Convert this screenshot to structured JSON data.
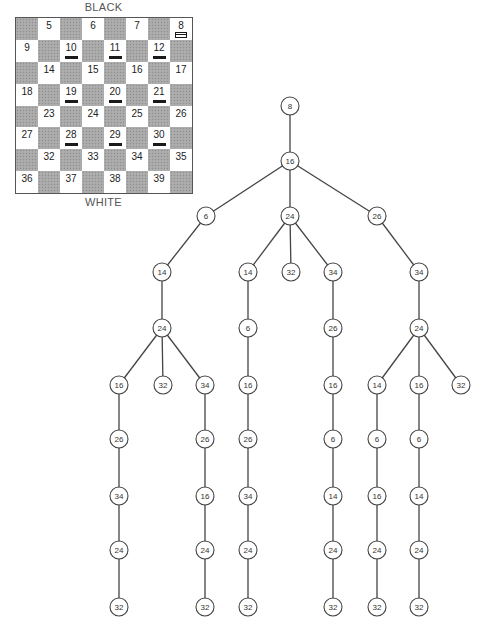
{
  "board": {
    "top_label": "BLACK",
    "bottom_label": "WHITE",
    "rows": [
      [
        {
          "n": ""
        },
        {
          "n": "5"
        },
        {
          "n": ""
        },
        {
          "n": "6"
        },
        {
          "n": ""
        },
        {
          "n": "7"
        },
        {
          "n": ""
        },
        {
          "n": "8",
          "piece": "white"
        }
      ],
      [
        {
          "n": "9"
        },
        {
          "n": ""
        },
        {
          "n": "10",
          "piece": "black"
        },
        {
          "n": ""
        },
        {
          "n": "11",
          "piece": "black"
        },
        {
          "n": ""
        },
        {
          "n": "12",
          "piece": "black"
        },
        {
          "n": ""
        }
      ],
      [
        {
          "n": ""
        },
        {
          "n": "14"
        },
        {
          "n": ""
        },
        {
          "n": "15"
        },
        {
          "n": ""
        },
        {
          "n": "16"
        },
        {
          "n": ""
        },
        {
          "n": "17"
        }
      ],
      [
        {
          "n": "18"
        },
        {
          "n": ""
        },
        {
          "n": "19",
          "piece": "black"
        },
        {
          "n": ""
        },
        {
          "n": "20",
          "piece": "black"
        },
        {
          "n": ""
        },
        {
          "n": "21",
          "piece": "black"
        },
        {
          "n": ""
        }
      ],
      [
        {
          "n": ""
        },
        {
          "n": "23"
        },
        {
          "n": ""
        },
        {
          "n": "24"
        },
        {
          "n": ""
        },
        {
          "n": "25"
        },
        {
          "n": ""
        },
        {
          "n": "26"
        }
      ],
      [
        {
          "n": "27"
        },
        {
          "n": ""
        },
        {
          "n": "28",
          "piece": "black"
        },
        {
          "n": ""
        },
        {
          "n": "29",
          "piece": "black"
        },
        {
          "n": ""
        },
        {
          "n": "30",
          "piece": "black"
        },
        {
          "n": ""
        }
      ],
      [
        {
          "n": ""
        },
        {
          "n": "32"
        },
        {
          "n": ""
        },
        {
          "n": "33"
        },
        {
          "n": ""
        },
        {
          "n": "34"
        },
        {
          "n": ""
        },
        {
          "n": "35"
        }
      ],
      [
        {
          "n": "36"
        },
        {
          "n": ""
        },
        {
          "n": "37"
        },
        {
          "n": ""
        },
        {
          "n": "38"
        },
        {
          "n": ""
        },
        {
          "n": "39"
        },
        {
          "n": ""
        }
      ]
    ]
  },
  "tree": {
    "nodes": [
      {
        "id": "n0",
        "label": "8",
        "x": 290,
        "y": 106
      },
      {
        "id": "n1",
        "label": "16",
        "x": 290,
        "y": 161
      },
      {
        "id": "n2",
        "label": "6",
        "x": 206,
        "y": 216
      },
      {
        "id": "n3",
        "label": "24",
        "x": 290,
        "y": 216
      },
      {
        "id": "n4",
        "label": "26",
        "x": 377,
        "y": 216
      },
      {
        "id": "n5",
        "label": "14",
        "x": 162,
        "y": 272
      },
      {
        "id": "n6",
        "label": "14",
        "x": 248,
        "y": 272
      },
      {
        "id": "n7",
        "label": "32",
        "x": 291,
        "y": 272
      },
      {
        "id": "n8",
        "label": "34",
        "x": 333,
        "y": 272
      },
      {
        "id": "n9",
        "label": "34",
        "x": 419,
        "y": 272
      },
      {
        "id": "n10",
        "label": "24",
        "x": 162,
        "y": 328
      },
      {
        "id": "n11",
        "label": "6",
        "x": 248,
        "y": 328
      },
      {
        "id": "n12",
        "label": "26",
        "x": 333,
        "y": 328
      },
      {
        "id": "n13",
        "label": "24",
        "x": 419,
        "y": 328
      },
      {
        "id": "n14",
        "label": "16",
        "x": 119,
        "y": 385
      },
      {
        "id": "n15",
        "label": "32",
        "x": 163,
        "y": 385
      },
      {
        "id": "n16",
        "label": "34",
        "x": 205,
        "y": 385
      },
      {
        "id": "n17",
        "label": "16",
        "x": 248,
        "y": 385
      },
      {
        "id": "n18",
        "label": "16",
        "x": 333,
        "y": 385
      },
      {
        "id": "n19",
        "label": "14",
        "x": 377,
        "y": 385
      },
      {
        "id": "n20",
        "label": "16",
        "x": 419,
        "y": 385
      },
      {
        "id": "n21",
        "label": "32",
        "x": 461,
        "y": 385
      },
      {
        "id": "n22",
        "label": "26",
        "x": 119,
        "y": 439
      },
      {
        "id": "n23",
        "label": "26",
        "x": 205,
        "y": 439
      },
      {
        "id": "n24",
        "label": "26",
        "x": 248,
        "y": 439
      },
      {
        "id": "n25",
        "label": "6",
        "x": 333,
        "y": 439
      },
      {
        "id": "n26",
        "label": "6",
        "x": 377,
        "y": 439
      },
      {
        "id": "n27",
        "label": "6",
        "x": 419,
        "y": 439
      },
      {
        "id": "n28",
        "label": "34",
        "x": 119,
        "y": 496
      },
      {
        "id": "n29",
        "label": "16",
        "x": 205,
        "y": 496
      },
      {
        "id": "n30",
        "label": "34",
        "x": 248,
        "y": 496
      },
      {
        "id": "n31",
        "label": "14",
        "x": 333,
        "y": 496
      },
      {
        "id": "n32",
        "label": "16",
        "x": 377,
        "y": 496
      },
      {
        "id": "n33",
        "label": "14",
        "x": 419,
        "y": 496
      },
      {
        "id": "n34",
        "label": "24",
        "x": 119,
        "y": 550
      },
      {
        "id": "n35",
        "label": "24",
        "x": 205,
        "y": 550
      },
      {
        "id": "n36",
        "label": "24",
        "x": 248,
        "y": 550
      },
      {
        "id": "n37",
        "label": "24",
        "x": 333,
        "y": 550
      },
      {
        "id": "n38",
        "label": "24",
        "x": 377,
        "y": 550
      },
      {
        "id": "n39",
        "label": "24",
        "x": 419,
        "y": 550
      },
      {
        "id": "n40",
        "label": "32",
        "x": 119,
        "y": 607
      },
      {
        "id": "n41",
        "label": "32",
        "x": 205,
        "y": 607
      },
      {
        "id": "n42",
        "label": "32",
        "x": 248,
        "y": 607
      },
      {
        "id": "n43",
        "label": "32",
        "x": 333,
        "y": 607
      },
      {
        "id": "n44",
        "label": "32",
        "x": 377,
        "y": 607
      },
      {
        "id": "n45",
        "label": "32",
        "x": 419,
        "y": 607
      }
    ],
    "edges": [
      [
        "n0",
        "n1"
      ],
      [
        "n1",
        "n2"
      ],
      [
        "n1",
        "n3"
      ],
      [
        "n1",
        "n4"
      ],
      [
        "n2",
        "n5"
      ],
      [
        "n3",
        "n6"
      ],
      [
        "n3",
        "n7"
      ],
      [
        "n3",
        "n8"
      ],
      [
        "n4",
        "n9"
      ],
      [
        "n5",
        "n10"
      ],
      [
        "n6",
        "n11"
      ],
      [
        "n8",
        "n12"
      ],
      [
        "n9",
        "n13"
      ],
      [
        "n10",
        "n14"
      ],
      [
        "n10",
        "n15"
      ],
      [
        "n10",
        "n16"
      ],
      [
        "n11",
        "n17"
      ],
      [
        "n12",
        "n18"
      ],
      [
        "n13",
        "n19"
      ],
      [
        "n13",
        "n20"
      ],
      [
        "n13",
        "n21"
      ],
      [
        "n14",
        "n22"
      ],
      [
        "n16",
        "n23"
      ],
      [
        "n17",
        "n24"
      ],
      [
        "n18",
        "n25"
      ],
      [
        "n19",
        "n26"
      ],
      [
        "n20",
        "n27"
      ],
      [
        "n22",
        "n28"
      ],
      [
        "n23",
        "n29"
      ],
      [
        "n24",
        "n30"
      ],
      [
        "n25",
        "n31"
      ],
      [
        "n26",
        "n32"
      ],
      [
        "n27",
        "n33"
      ],
      [
        "n28",
        "n34"
      ],
      [
        "n29",
        "n35"
      ],
      [
        "n30",
        "n36"
      ],
      [
        "n31",
        "n37"
      ],
      [
        "n32",
        "n38"
      ],
      [
        "n33",
        "n39"
      ],
      [
        "n34",
        "n40"
      ],
      [
        "n35",
        "n41"
      ],
      [
        "n36",
        "n42"
      ],
      [
        "n37",
        "n43"
      ],
      [
        "n38",
        "n44"
      ],
      [
        "n39",
        "n45"
      ]
    ],
    "node_radius": 9
  }
}
